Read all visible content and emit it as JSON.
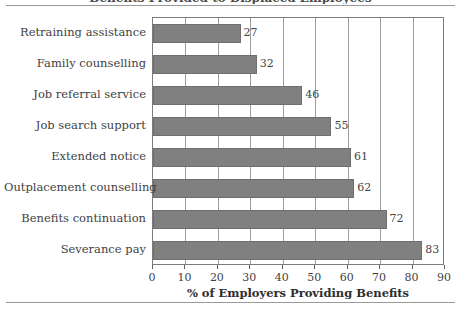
{
  "figure": {
    "title_sliver": "Benefits Provided to Displaced Employees"
  },
  "axis": {
    "x_title": "% of Employers Providing Benefits",
    "x_ticks": [
      "0",
      "10",
      "20",
      "30",
      "40",
      "50",
      "60",
      "70",
      "80",
      "90"
    ]
  },
  "chart_data": {
    "type": "bar",
    "orientation": "horizontal",
    "title": "",
    "xlabel": "% of Employers Providing Benefits",
    "ylabel": "",
    "xlim": [
      0,
      90
    ],
    "xticks": [
      0,
      10,
      20,
      30,
      40,
      50,
      60,
      70,
      80,
      90
    ],
    "grid": "vertical",
    "legend": "none",
    "bar_color": "#808080",
    "categories": [
      "Retraining assistance",
      "Family counselling",
      "Job referral service",
      "Job search support",
      "Extended notice",
      "Outplacement counselling",
      "Benefits continuation",
      "Severance pay"
    ],
    "values": [
      27,
      32,
      46,
      55,
      61,
      62,
      72,
      83
    ],
    "data_labels": [
      "27",
      "32",
      "46",
      "55",
      "61",
      "62",
      "72",
      "83"
    ]
  }
}
